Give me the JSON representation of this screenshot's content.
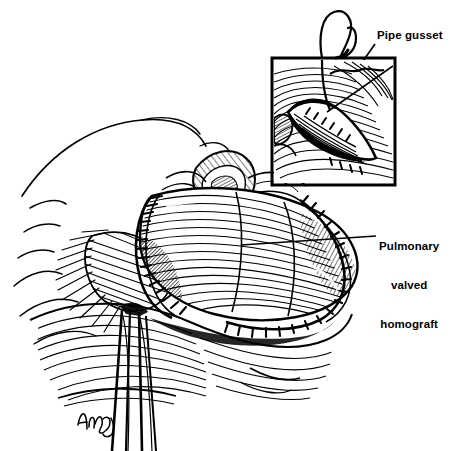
{
  "figure": {
    "type": "medical-illustration",
    "style": "black-and-white pen-and-ink line engraving with cross-hatching",
    "background_color": "#ffffff",
    "ink_color": "#000000",
    "width": 455,
    "height": 451
  },
  "labels": [
    {
      "id": "pipe-gusset",
      "text": "Pipe gusset",
      "lines": [
        "Pipe gusset"
      ],
      "align": "left",
      "x": 377,
      "y": 29,
      "leader": {
        "from_x": 375,
        "from_y": 44,
        "to_x": 327,
        "to_y": 112
      }
    },
    {
      "id": "pulmonary-valved-homograft",
      "text": "Pulmonary valved homograft",
      "lines": [
        "Pulmonary",
        "valved",
        "homograft"
      ],
      "align": "center",
      "x": 379,
      "y": 214,
      "leader": {
        "from_x": 376,
        "from_y": 236,
        "to_x": 241,
        "to_y": 245
      }
    }
  ],
  "inset": {
    "name": "pipe-gusset-detail-inset",
    "border_color": "#000000",
    "border_width": 3,
    "x": 272,
    "y": 58,
    "width": 123,
    "height": 127,
    "contents": "close-up of the gusset patch sutured into the vessel wall, with suture thread looping above the frame"
  },
  "elements": {
    "suture_thread": "curved suture thread with loop rising above the inset frame",
    "homograft_conduit": "tubular pulmonary valved homograft spanning the center of the field",
    "proximal_suture_line": "stitched anastomosis band at the left end of the conduit",
    "distal_suture_line": "stitched anastomosis band at the right end of the conduit",
    "retracted_tissue": "retracted pericardial and tissue edges at the left of the field",
    "instrument": "surgical retractor/instrument entering from the lower center",
    "signature": "artist cursive signature at lower left"
  },
  "colors": {
    "ink": "#000000",
    "paper": "#ffffff",
    "label_text": "#000000"
  }
}
